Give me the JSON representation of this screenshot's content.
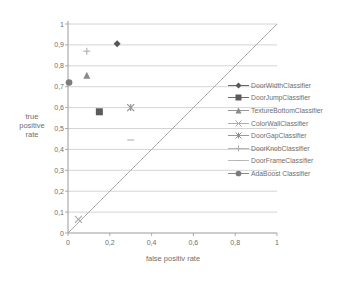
{
  "figure": {
    "background": "#ffffff",
    "text_color": "#6e6e6e",
    "gridline_color": "#c9c9c9",
    "axis_color": "#9a9a9a",
    "diagonal_color": "#a0a0a0"
  },
  "chart_data": {
    "type": "scatter",
    "title": "",
    "xlabel": "false positiv rate",
    "ylabel": "true positive rate",
    "ylabel_lines": [
      "true",
      "positive",
      "rate"
    ],
    "xlim": [
      0,
      1
    ],
    "ylim": [
      0,
      1
    ],
    "grid": "horizontal",
    "legend_position": "right-overlap",
    "diagonal_reference_line": {
      "from": [
        0,
        0
      ],
      "to": [
        1,
        1
      ]
    },
    "x_ticks": [
      {
        "value": 0,
        "label": "0"
      },
      {
        "value": 0.2,
        "label": "0,2"
      },
      {
        "value": 0.4,
        "label": "0,4"
      },
      {
        "value": 0.6,
        "label": "0,6"
      },
      {
        "value": 0.8,
        "label": "0,8"
      },
      {
        "value": 1,
        "label": "1"
      }
    ],
    "y_ticks": [
      {
        "value": 0,
        "label": "0"
      },
      {
        "value": 0.1,
        "label": "0,1"
      },
      {
        "value": 0.2,
        "label": "0,2"
      },
      {
        "value": 0.3,
        "label": "0,3"
      },
      {
        "value": 0.4,
        "label": "0,4"
      },
      {
        "value": 0.5,
        "label": "0,5"
      },
      {
        "value": 0.6,
        "label": "0,6"
      },
      {
        "value": 0.7,
        "label": "0,7"
      },
      {
        "value": 0.8,
        "label": "0,8"
      },
      {
        "value": 0.9,
        "label": "0,9"
      },
      {
        "value": 1,
        "label": "1"
      }
    ],
    "series": [
      {
        "name": "DoorWidthClassifier",
        "marker": "diamond",
        "color": "#55555c",
        "points": [
          [
            0.235,
            0.905
          ]
        ]
      },
      {
        "name": "DoorJumpClassifier",
        "marker": "square",
        "color": "#5e5a5c",
        "points": [
          [
            0.15,
            0.58
          ]
        ]
      },
      {
        "name": "TextureBottomClassifier",
        "marker": "triangle",
        "color": "#8a8a8a",
        "points": [
          [
            0.09,
            0.755
          ]
        ]
      },
      {
        "name": "ColorWallClassifier",
        "marker": "x",
        "color": "#a6a6a6",
        "points": [
          [
            0.05,
            0.065
          ]
        ]
      },
      {
        "name": "DoorGapClassifier",
        "marker": "star",
        "color": "#8f8f8f",
        "points": [
          [
            0.3,
            0.6
          ]
        ]
      },
      {
        "name": "DoorKnobClassifier",
        "marker": "plus",
        "color": "#aeaeae",
        "points": [
          [
            0.09,
            0.87
          ]
        ]
      },
      {
        "name": "DoorFrameClassifier",
        "marker": "dash",
        "color": "#b2b2b2",
        "points": [
          [
            0.3,
            0.445
          ]
        ]
      },
      {
        "name": "AdaBoost Classifier",
        "marker": "circle",
        "color": "#7c7c7c",
        "points": [
          [
            0.005,
            0.72
          ]
        ]
      }
    ]
  },
  "plot_area": {
    "left": 68,
    "top": 24,
    "width": 209,
    "height": 209
  }
}
